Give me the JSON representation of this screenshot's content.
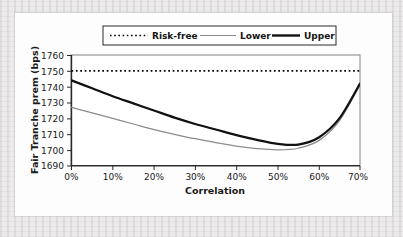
{
  "chart_data": {
    "type": "line",
    "title": "",
    "xlabel": "Correlation",
    "ylabel": "Fair Tranche prem (bps)",
    "xlim": [
      0,
      70
    ],
    "ylim": [
      1690,
      1760
    ],
    "xticks": [
      0,
      10,
      20,
      30,
      40,
      50,
      60,
      70
    ],
    "xticklabels": [
      "0%",
      "10%",
      "20%",
      "30%",
      "40%",
      "50%",
      "60%",
      "70%"
    ],
    "yticks": [
      1690,
      1700,
      1710,
      1720,
      1730,
      1740,
      1750,
      1760
    ],
    "yticklabels": [
      "1690",
      "1700",
      "1710",
      "1720",
      "1730",
      "1740",
      "1750",
      "1760"
    ],
    "grid": false,
    "legend_position": "above-plot",
    "x": [
      0,
      5,
      10,
      15,
      20,
      25,
      30,
      35,
      40,
      45,
      50,
      55,
      60,
      65,
      70
    ],
    "series": [
      {
        "name": "Risk-free",
        "style": "dotted",
        "color": "#000000",
        "constant_value": 1750,
        "values": [
          1750,
          1750,
          1750,
          1750,
          1750,
          1750,
          1750,
          1750,
          1750,
          1750,
          1750,
          1750,
          1750,
          1750,
          1750
        ]
      },
      {
        "name": "Lower",
        "style": "thin-solid",
        "color": "#8c8c8c",
        "values": [
          1727.0,
          1723.5,
          1720.0,
          1716.5,
          1713.0,
          1710.0,
          1707.2,
          1704.8,
          1702.6,
          1701.0,
          1700.2,
          1701.2,
          1706.0,
          1718.5,
          1741.0
        ]
      },
      {
        "name": "Upper",
        "style": "thick-solid",
        "color": "#111111",
        "values": [
          1744.0,
          1739.0,
          1734.0,
          1729.5,
          1725.0,
          1720.5,
          1716.5,
          1713.0,
          1709.5,
          1706.5,
          1704.0,
          1703.5,
          1708.0,
          1720.0,
          1742.0
        ]
      }
    ],
    "annotations": []
  },
  "legend": {
    "items": [
      {
        "label": "Risk-free"
      },
      {
        "label": "Lower"
      },
      {
        "label": "Upper"
      }
    ]
  },
  "axes": {
    "y_title": "Fair Tranche prem (bps)",
    "x_title": "Correlation"
  }
}
